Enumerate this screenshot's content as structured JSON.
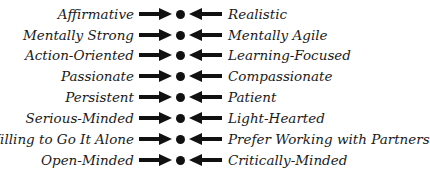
{
  "diagram": {
    "pairs": [
      {
        "left": "Affirmative",
        "right": "Realistic"
      },
      {
        "left": "Mentally Strong",
        "right": "Mentally Agile"
      },
      {
        "left": "Action-Oriented",
        "right": "Learning-Focused"
      },
      {
        "left": "Passionate",
        "right": "Compassionate"
      },
      {
        "left": "Persistent",
        "right": "Patient"
      },
      {
        "left": "Serious-Minded",
        "right": "Light-Hearted"
      },
      {
        "left": "Willing to Go It Alone",
        "right": "Prefer Working with Partners"
      },
      {
        "left": "Open-Minded",
        "right": "Critically-Minded"
      }
    ],
    "colors": {
      "text": "#1a1a1a",
      "arrow": "#111111",
      "background": "#ffffff"
    }
  }
}
